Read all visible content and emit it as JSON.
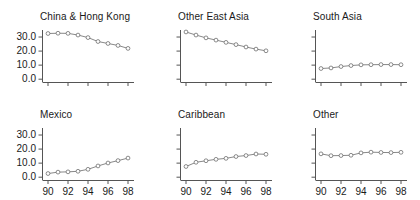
{
  "figure": {
    "layout": "2x3 small multiples",
    "rows": 2,
    "cols": 3
  },
  "chart_data": {
    "type": "line",
    "title": "",
    "xlabel": "",
    "ylabel": "",
    "x": [
      90,
      91,
      92,
      93,
      94,
      95,
      96,
      97,
      98
    ],
    "xtick_labels": [
      "90",
      "92",
      "94",
      "96",
      "98"
    ],
    "xticks": [
      90,
      92,
      94,
      96,
      98
    ],
    "ytick_labels": [
      "0.0",
      "10.0",
      "20.0",
      "30.0"
    ],
    "yticks": [
      0,
      10,
      20,
      30
    ],
    "ylim": [
      -2,
      35
    ],
    "xlim": [
      89.4,
      98.6
    ],
    "grid": false,
    "legend": "none",
    "marker": "open-circle",
    "line_color": "#7a7a7a",
    "marker_edge_color": "#6e6e6e",
    "marker_face_color": "#ffffff",
    "axis_color": "#555555",
    "panels": [
      {
        "title": "China & Hong Kong",
        "row": 0,
        "col": 0,
        "show_ylabels": true,
        "show_xlabels": false,
        "values": [
          32.5,
          32.7,
          32.6,
          31.4,
          29.6,
          26.8,
          25.4,
          24.0,
          21.9
        ]
      },
      {
        "title": "Other East Asia",
        "row": 0,
        "col": 1,
        "show_ylabels": false,
        "show_xlabels": false,
        "values": [
          33.6,
          31.4,
          29.4,
          27.8,
          26.2,
          24.6,
          22.9,
          21.4,
          20.2
        ]
      },
      {
        "title": "South Asia",
        "row": 0,
        "col": 2,
        "show_ylabels": false,
        "show_xlabels": false,
        "values": [
          7.6,
          8.0,
          9.0,
          9.7,
          10.2,
          10.3,
          10.4,
          10.4,
          10.3
        ]
      },
      {
        "title": "Mexico",
        "row": 1,
        "col": 0,
        "show_ylabels": true,
        "show_xlabels": true,
        "values": [
          2.6,
          3.6,
          3.8,
          4.2,
          5.6,
          8.0,
          10.1,
          11.8,
          13.6
        ]
      },
      {
        "title": "Caribbean",
        "row": 1,
        "col": 1,
        "show_ylabels": false,
        "show_xlabels": true,
        "values": [
          7.6,
          10.6,
          11.7,
          12.7,
          13.4,
          14.7,
          15.4,
          16.5,
          16.3
        ]
      },
      {
        "title": "Other",
        "row": 1,
        "col": 2,
        "show_ylabels": false,
        "show_xlabels": true,
        "values": [
          16.6,
          15.3,
          15.4,
          15.6,
          17.3,
          17.8,
          17.6,
          17.5,
          17.7
        ]
      }
    ]
  }
}
